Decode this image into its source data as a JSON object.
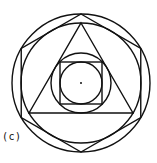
{
  "figure": {
    "label": "(c)",
    "stroke_color": "#111111",
    "background": "#ffffff",
    "center": [
      81,
      83
    ],
    "shapes": [
      {
        "name": "outer-circle",
        "type": "circle",
        "r": 69
      },
      {
        "name": "hexagon",
        "type": "hexagon",
        "circumradius": 69,
        "orientation": "vertex-up"
      },
      {
        "name": "hexagon-incircle",
        "type": "circle",
        "r": 60
      },
      {
        "name": "triangle",
        "type": "triangle",
        "circumradius": 60,
        "orientation": "apex-up"
      },
      {
        "name": "triangle-incircle",
        "type": "circle",
        "r": 30
      },
      {
        "name": "square",
        "type": "square",
        "half_side": 21
      },
      {
        "name": "square-incircle",
        "type": "circle",
        "r": 21
      },
      {
        "name": "center-dot",
        "type": "dot",
        "r": 1
      }
    ]
  }
}
